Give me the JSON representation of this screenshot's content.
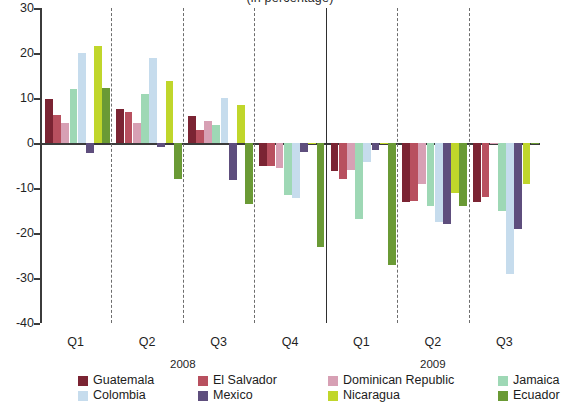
{
  "title": "(in percentage)",
  "axis": {
    "y_ticks": [
      "30",
      "20",
      "10",
      "0",
      "-10",
      "-20",
      "-30",
      "-40"
    ],
    "quarter_labels": [
      "Q1",
      "Q2",
      "Q3",
      "Q4",
      "Q1",
      "Q2",
      "Q3"
    ],
    "year_labels": [
      "2008",
      "2009"
    ]
  },
  "legend": {
    "row1": [
      {
        "label": "Guatemala",
        "color": "#7b2433"
      },
      {
        "label": "El Salvador",
        "color": "#b8505f"
      },
      {
        "label": "Dominican Republic",
        "color": "#d7a0b4"
      },
      {
        "label": "Jamaica",
        "color": "#9ed8b5"
      },
      {
        "label": "Colombia",
        "color": "#c6dced"
      }
    ],
    "row2": [
      {
        "label": "Colombia",
        "color": "#c6dced"
      },
      {
        "label": "Mexico",
        "color": "#5e4e7d"
      },
      {
        "label": "Nicaragua",
        "color": "#c0d62b"
      },
      {
        "label": "Ecuador",
        "color": "#6a9a35"
      }
    ]
  },
  "chart_data": {
    "type": "bar",
    "title": "(in percentage)",
    "xlabel": "",
    "ylabel": "",
    "ylim": [
      -40,
      30
    ],
    "ytick_step": 10,
    "grid": false,
    "legend_position": "bottom",
    "categories": [
      "2008 Q1",
      "2008 Q2",
      "2008 Q3",
      "2008 Q4",
      "2009 Q1",
      "2009 Q2",
      "2009 Q3"
    ],
    "series": [
      {
        "name": "Guatemala",
        "color": "#7b2433",
        "values": [
          9.8,
          7.6,
          6.1,
          -5.0,
          -6.2,
          -13.0,
          -13.2
        ]
      },
      {
        "name": "El Salvador",
        "color": "#b8505f",
        "values": [
          6.2,
          7.0,
          2.8,
          -5.1,
          -8.0,
          -12.8,
          -12.0
        ]
      },
      {
        "name": "Dominican Republic",
        "color": "#d7a0b4",
        "values": [
          4.4,
          4.5,
          4.8,
          -5.6,
          -6.1,
          -9.0,
          -0.2
        ]
      },
      {
        "name": "Jamaica",
        "color": "#9ed8b5",
        "values": [
          11.9,
          10.9,
          3.9,
          -11.6,
          -16.9,
          -14.0,
          -15.2
        ]
      },
      {
        "name": "Colombia",
        "color": "#c6dced",
        "values": [
          19.9,
          18.9,
          10.1,
          -12.2,
          -4.2,
          -17.5,
          -29.0
        ]
      },
      {
        "name": "Mexico",
        "color": "#5e4e7d",
        "values": [
          -2.2,
          -0.9,
          -8.2,
          -2.1,
          -1.5,
          -18.0,
          -19.0
        ]
      },
      {
        "name": "Nicaragua",
        "color": "#c0d62b",
        "values": [
          21.6,
          13.8,
          8.5,
          -0.2,
          -0.3,
          -11.0,
          -9.0
        ]
      },
      {
        "name": "Ecuador",
        "color": "#6a9a35",
        "values": [
          12.3,
          -7.9,
          -13.5,
          -23.0,
          -27.0,
          -14.0,
          -0.2
        ]
      }
    ]
  }
}
